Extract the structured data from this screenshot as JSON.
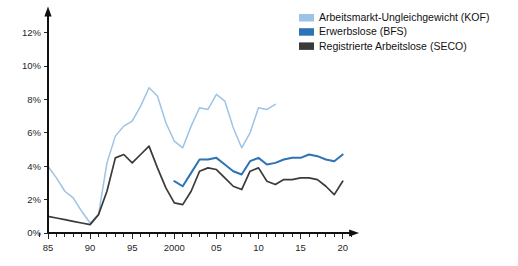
{
  "chart_data": {
    "type": "line",
    "title": "",
    "xlabel": "",
    "ylabel": "",
    "xlim": [
      1984,
      2021
    ],
    "ylim": [
      0,
      13.2
    ],
    "grid": false,
    "legend_position": "top-right",
    "y_ticks": [
      "0%",
      "2%",
      "4%",
      "6%",
      "8%",
      "10%",
      "12%"
    ],
    "y_tick_values": [
      0,
      2,
      4,
      6,
      8,
      10,
      12
    ],
    "x_ticks": [
      "85",
      "90",
      "95",
      "2000",
      "05",
      "10",
      "15",
      "20"
    ],
    "x_tick_values": [
      1985,
      1990,
      1995,
      2000,
      2005,
      2010,
      2015,
      2020
    ],
    "x_minor_start": 1984,
    "x_minor_end": 2021,
    "series": [
      {
        "name": "Arbeitsmarkt-Ungleichgewicht (KOF)",
        "color": "#9dc3e6",
        "width": 1.5,
        "x": [
          1985,
          1986,
          1987,
          1988,
          1989,
          1990,
          1991,
          1992,
          1993,
          1994,
          1995,
          1996,
          1997,
          1998,
          1999,
          2000,
          2001,
          2002,
          2003,
          2004,
          2005,
          2006,
          2007,
          2008,
          2009,
          2010,
          2011,
          2012
        ],
        "values": [
          4.0,
          3.3,
          2.5,
          2.1,
          1.3,
          0.6,
          1.1,
          4.2,
          5.8,
          6.4,
          6.7,
          7.6,
          8.7,
          8.2,
          6.6,
          5.5,
          5.1,
          6.4,
          7.5,
          7.4,
          8.3,
          7.9,
          6.3,
          5.1,
          6.0,
          7.5,
          7.4,
          7.7
        ]
      },
      {
        "name": "Erwerbslose (BFS)",
        "color": "#2e74b5",
        "width": 2.0,
        "x": [
          2000,
          2001,
          2002,
          2003,
          2004,
          2005,
          2006,
          2007,
          2008,
          2009,
          2010,
          2011,
          2012,
          2013,
          2014,
          2015,
          2016,
          2017,
          2018,
          2019,
          2020
        ],
        "values": [
          3.1,
          2.8,
          3.6,
          4.4,
          4.4,
          4.5,
          4.1,
          3.7,
          3.5,
          4.3,
          4.5,
          4.1,
          4.2,
          4.4,
          4.5,
          4.5,
          4.7,
          4.6,
          4.4,
          4.3,
          4.7
        ]
      },
      {
        "name": "Registrierte Arbeitslose (SECO)",
        "color": "#3a3a3a",
        "width": 1.7,
        "x": [
          1985,
          1986,
          1987,
          1988,
          1989,
          1990,
          1991,
          1992,
          1993,
          1994,
          1995,
          1996,
          1997,
          1998,
          1999,
          2000,
          2001,
          2002,
          2003,
          2004,
          2005,
          2006,
          2007,
          2008,
          2009,
          2010,
          2011,
          2012,
          2013,
          2014,
          2015,
          2016,
          2017,
          2018,
          2019,
          2020
        ],
        "values": [
          1.0,
          0.9,
          0.8,
          0.7,
          0.6,
          0.5,
          1.1,
          2.5,
          4.5,
          4.7,
          4.2,
          4.7,
          5.2,
          3.9,
          2.7,
          1.8,
          1.7,
          2.5,
          3.7,
          3.9,
          3.8,
          3.3,
          2.8,
          2.6,
          3.7,
          3.9,
          3.1,
          2.9,
          3.2,
          3.2,
          3.3,
          3.3,
          3.2,
          2.8,
          2.3,
          3.1
        ]
      }
    ]
  },
  "legend": {
    "items": [
      {
        "label": "Arbeitsmarkt-Ungleichgewicht (KOF)",
        "color": "#9dc3e6"
      },
      {
        "label": "Erwerbslose (BFS)",
        "color": "#2e74b5"
      },
      {
        "label": "Registrierte Arbeitslose (SECO)",
        "color": "#3a3a3a"
      }
    ]
  }
}
